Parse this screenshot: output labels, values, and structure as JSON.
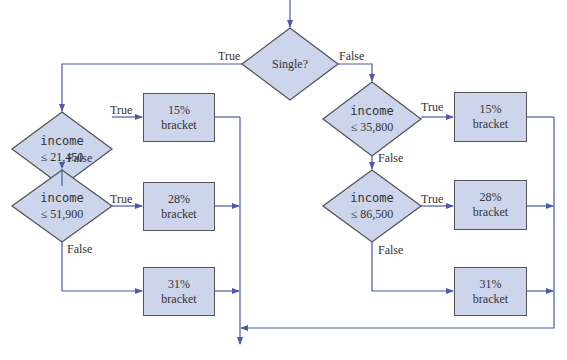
{
  "diagram": {
    "type": "flowchart",
    "colors": {
      "shape_fill": "#ccd5ec",
      "shape_border": "#555555",
      "connector": "#4a5aa8",
      "text": "#333333"
    },
    "start_decision": {
      "label": "Single?",
      "true_label": "True",
      "false_label": "False"
    },
    "single_branch": {
      "decision1": {
        "variable": "income",
        "condition": "≤ 21,450",
        "true_label": "True",
        "false_label": "False"
      },
      "box1": {
        "rate": "15%",
        "word": "bracket"
      },
      "decision2": {
        "variable": "income",
        "condition": "≤ 51,900",
        "true_label": "True",
        "false_label": "False"
      },
      "box2": {
        "rate": "28%",
        "word": "bracket"
      },
      "box3": {
        "rate": "31%",
        "word": "bracket"
      }
    },
    "married_branch": {
      "decision1": {
        "variable": "income",
        "condition": "≤ 35,800",
        "true_label": "True",
        "false_label": "False"
      },
      "box1": {
        "rate": "15%",
        "word": "bracket"
      },
      "decision2": {
        "variable": "income",
        "condition": "≤ 86,500",
        "true_label": "True",
        "false_label": "False"
      },
      "box2": {
        "rate": "28%",
        "word": "bracket"
      },
      "box3": {
        "rate": "31%",
        "word": "bracket"
      }
    }
  }
}
